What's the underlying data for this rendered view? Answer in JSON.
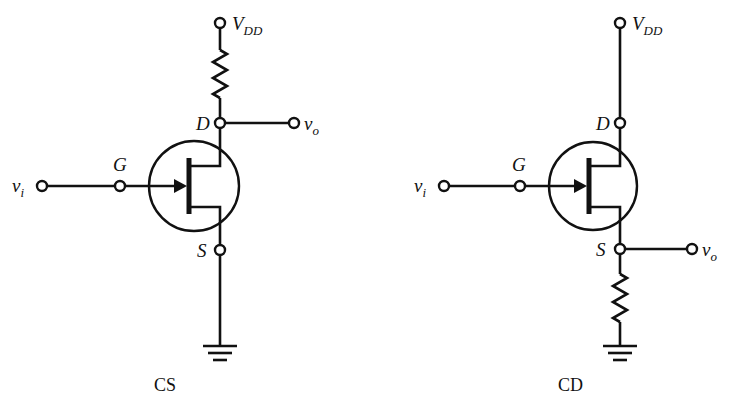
{
  "circuits": [
    {
      "id": "cs",
      "caption": "CS",
      "labels": {
        "supply": "V",
        "supply_sub": "DD",
        "drain": "D",
        "gate": "G",
        "source": "S",
        "input": "v",
        "input_sub": "i",
        "output": "v",
        "output_sub": "o"
      },
      "load_resistor_position": "drain",
      "output_node": "drain"
    },
    {
      "id": "cd",
      "caption": "CD",
      "labels": {
        "supply": "V",
        "supply_sub": "DD",
        "drain": "D",
        "gate": "G",
        "source": "S",
        "input": "v",
        "input_sub": "i",
        "output": "v",
        "output_sub": "o"
      },
      "load_resistor_position": "source",
      "output_node": "source"
    }
  ]
}
